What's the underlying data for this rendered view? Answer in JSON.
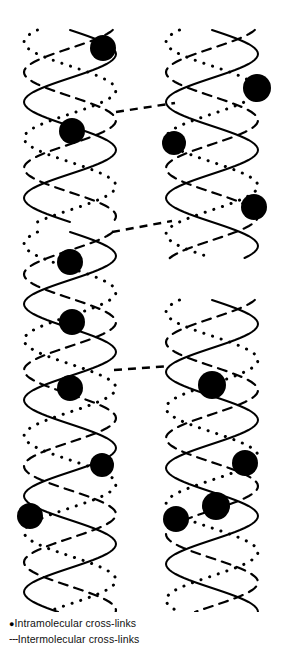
{
  "figure": {
    "background": "#ffffff",
    "ink": "#000000",
    "width": 282,
    "height": 650,
    "strands": {
      "solid": {
        "name": "solid-strand",
        "style": "solid",
        "stroke_width": 2.0
      },
      "dashed": {
        "name": "dashed-strand",
        "style": "dashed",
        "stroke_width": 2.2,
        "dash": "9 7"
      },
      "dotted": {
        "name": "dotted-strand",
        "style": "dotted",
        "stroke_width": 3.0,
        "dash": "0.1 9"
      }
    },
    "geometry": {
      "columns": [
        {
          "id": "left",
          "center_x": 70,
          "amplitude": 46
        },
        {
          "id": "right",
          "center_x": 212,
          "amplitude": 46
        }
      ],
      "period": 96,
      "phase_offsets": {
        "solid": 0,
        "dashed": 0.62,
        "dotted": 1.25
      },
      "segments": [
        {
          "id": "left-upper",
          "column": "left",
          "y_start": 30,
          "y_end": 222
        },
        {
          "id": "left-lower",
          "column": "left",
          "y_start": 232,
          "y_end": 612
        },
        {
          "id": "right-upper",
          "column": "right",
          "y_start": 30,
          "y_end": 258
        },
        {
          "id": "right-lower",
          "column": "right",
          "y_start": 300,
          "y_end": 612
        }
      ]
    },
    "intramolecular_nodes": [
      {
        "id": "n1",
        "cx": 103,
        "cy": 48,
        "r": 13
      },
      {
        "id": "n2",
        "cx": 72,
        "cy": 131,
        "r": 13
      },
      {
        "id": "n3",
        "cx": 70,
        "cy": 262,
        "r": 13
      },
      {
        "id": "n4",
        "cx": 72,
        "cy": 322,
        "r": 13
      },
      {
        "id": "n5",
        "cx": 70,
        "cy": 388,
        "r": 13
      },
      {
        "id": "n6",
        "cx": 102,
        "cy": 465,
        "r": 12
      },
      {
        "id": "n7",
        "cx": 30,
        "cy": 516,
        "r": 13
      },
      {
        "id": "n8",
        "cx": 257,
        "cy": 88,
        "r": 14
      },
      {
        "id": "n9",
        "cx": 174,
        "cy": 143,
        "r": 12
      },
      {
        "id": "n10",
        "cx": 254,
        "cy": 207,
        "r": 13
      },
      {
        "id": "n11",
        "cx": 212,
        "cy": 385,
        "r": 14
      },
      {
        "id": "n12",
        "cx": 245,
        "cy": 463,
        "r": 13
      },
      {
        "id": "n13",
        "cx": 216,
        "cy": 506,
        "r": 14
      },
      {
        "id": "n14",
        "cx": 176,
        "cy": 519,
        "r": 13
      }
    ],
    "intermolecular_links": [
      {
        "id": "l1",
        "x1": 116,
        "y1": 112,
        "x2": 175,
        "y2": 103
      },
      {
        "id": "l2",
        "x1": 112,
        "y1": 232,
        "x2": 172,
        "y2": 221
      },
      {
        "id": "l3",
        "x1": 114,
        "y1": 370,
        "x2": 170,
        "y2": 366
      }
    ]
  },
  "legend": {
    "items": [
      {
        "marker": "●",
        "marker_kind": "bullet",
        "label": "Intramolecular cross-links"
      },
      {
        "marker": "---",
        "marker_kind": "dashes",
        "label": "Intermolecular cross-links"
      }
    ]
  }
}
